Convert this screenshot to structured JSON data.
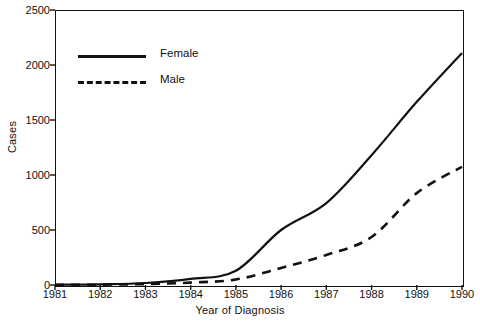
{
  "chart_data": {
    "type": "line",
    "title": "",
    "xlabel": "Year of Diagnosis",
    "ylabel": "Cases",
    "x": [
      1981,
      1982,
      1983,
      1984,
      1985,
      1986,
      1987,
      1988,
      1989,
      1990
    ],
    "xlim": [
      1981,
      1990
    ],
    "ylim": [
      0,
      2500
    ],
    "grid": false,
    "legend_position": "upper left",
    "xticks": [
      "1981",
      "1982",
      "1983",
      "1984",
      "1985",
      "1986",
      "1987",
      "1988",
      "1989",
      "1990"
    ],
    "yticks": [
      "0",
      "500",
      "1000",
      "1500",
      "2000",
      "2500"
    ],
    "ytick_values": [
      0,
      500,
      1000,
      1500,
      2000,
      2500
    ],
    "series": [
      {
        "name": "Female",
        "style": "solid",
        "color": "#111111",
        "values": [
          2,
          6,
          18,
          55,
          130,
          500,
          745,
          1180,
          1665,
          2110
        ]
      },
      {
        "name": "Male",
        "style": "dashed",
        "color": "#111111",
        "values": [
          1,
          3,
          8,
          22,
          50,
          155,
          273,
          436,
          835,
          1075
        ]
      }
    ]
  },
  "legend": {
    "items": [
      {
        "label": "Female",
        "style": "solid"
      },
      {
        "label": "Male",
        "style": "dashed"
      }
    ]
  }
}
